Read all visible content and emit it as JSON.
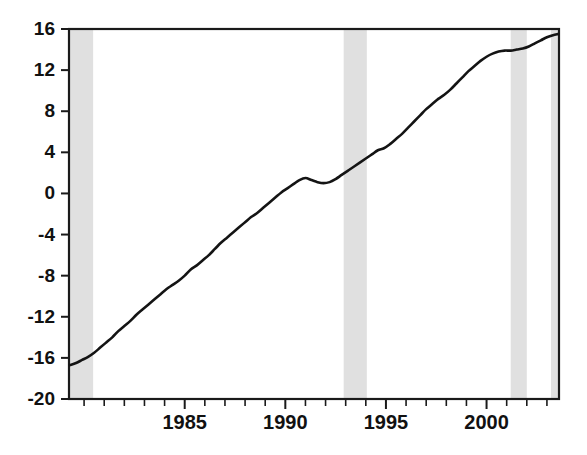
{
  "chart_data": {
    "type": "line",
    "title": "",
    "subtitle": "",
    "xlabel": "",
    "ylabel": "",
    "xlim": [
      1979.25,
      2003.6
    ],
    "ylim": [
      -20,
      16
    ],
    "grid": false,
    "legend": "none",
    "y_ticks": [
      16,
      12,
      8,
      4,
      0,
      -4,
      -8,
      -12,
      -16,
      -20
    ],
    "y_tick_labels": [
      "16",
      "12",
      "8",
      "4",
      "0",
      "-4",
      "-8",
      "-12",
      "-16",
      "-20"
    ],
    "x_ticks_major": [
      1985,
      1990,
      1995,
      2000
    ],
    "x_tick_labels": [
      "1985",
      "1990",
      "1995",
      "2000"
    ],
    "x_ticks_minor": [
      1980,
      1981,
      1982,
      1983,
      1984,
      1986,
      1987,
      1988,
      1989,
      1991,
      1992,
      1993,
      1994,
      1996,
      1997,
      1998,
      1999,
      2001,
      2002,
      2003
    ],
    "shaded_bands": [
      {
        "start": 1979.25,
        "end": 1980.45
      },
      {
        "start": 1992.9,
        "end": 1994.05
      },
      {
        "start": 2001.2,
        "end": 2002.0
      },
      {
        "start": 2003.2,
        "end": 2003.6
      }
    ],
    "shaded_band_color": "#e0e0e0",
    "line_color": "#141414",
    "series": [
      {
        "name": "cumulative series",
        "x": [
          1979.3,
          1979.6,
          1979.9,
          1980.2,
          1980.5,
          1980.8,
          1981.1,
          1981.4,
          1981.7,
          1982.0,
          1982.3,
          1982.6,
          1982.9,
          1983.2,
          1983.5,
          1983.8,
          1984.1,
          1984.4,
          1984.7,
          1985.0,
          1985.3,
          1985.6,
          1985.9,
          1986.2,
          1986.5,
          1986.8,
          1987.1,
          1987.4,
          1987.7,
          1988.0,
          1988.3,
          1988.6,
          1988.9,
          1989.2,
          1989.5,
          1989.8,
          1990.1,
          1990.4,
          1990.7,
          1991.0,
          1991.3,
          1991.6,
          1991.9,
          1992.2,
          1992.5,
          1992.8,
          1993.1,
          1993.4,
          1993.7,
          1994.0,
          1994.3,
          1994.6,
          1994.9,
          1995.2,
          1995.5,
          1995.8,
          1996.1,
          1996.4,
          1996.7,
          1997.0,
          1997.3,
          1997.6,
          1997.9,
          1998.2,
          1998.5,
          1998.8,
          1999.1,
          1999.4,
          1999.7,
          2000.0,
          2000.3,
          2000.6,
          2000.9,
          2001.2,
          2001.5,
          2001.8,
          2002.1,
          2002.4,
          2002.7,
          2003.0,
          2003.3,
          2003.55
        ],
        "y": [
          -16.7,
          -16.5,
          -16.2,
          -15.9,
          -15.5,
          -15.0,
          -14.5,
          -14.0,
          -13.4,
          -12.9,
          -12.4,
          -11.8,
          -11.3,
          -10.8,
          -10.3,
          -9.8,
          -9.3,
          -8.9,
          -8.5,
          -8.0,
          -7.4,
          -7.0,
          -6.5,
          -6.0,
          -5.4,
          -4.8,
          -4.3,
          -3.8,
          -3.3,
          -2.8,
          -2.3,
          -1.9,
          -1.4,
          -0.9,
          -0.4,
          0.1,
          0.5,
          0.9,
          1.3,
          1.5,
          1.3,
          1.1,
          1.0,
          1.1,
          1.4,
          1.8,
          2.2,
          2.6,
          3.0,
          3.4,
          3.8,
          4.2,
          4.4,
          4.8,
          5.3,
          5.8,
          6.4,
          7.0,
          7.6,
          8.2,
          8.7,
          9.2,
          9.6,
          10.1,
          10.7,
          11.3,
          11.9,
          12.4,
          12.9,
          13.3,
          13.6,
          13.8,
          13.9,
          13.9,
          14.0,
          14.1,
          14.3,
          14.6,
          14.9,
          15.2,
          15.4,
          15.5
        ]
      }
    ]
  },
  "axis": {
    "left_label_group": "y-axis-tick-labels",
    "bottom_label_group": "x-axis-tick-labels"
  }
}
